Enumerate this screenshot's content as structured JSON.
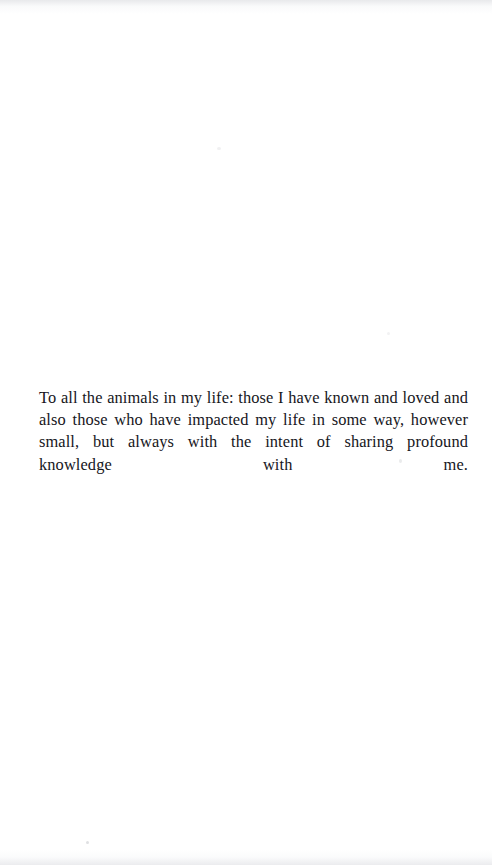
{
  "page": {
    "kind": "book-dedication-page",
    "background_color": "#ffffff",
    "text_color": "#16161c",
    "width_px": 492,
    "height_px": 865
  },
  "dedication": {
    "text": "To all the animals in my life: those I have known and loved and also those who have impacted my life in some way, however small, but always with the intent of sharing profound knowledge with me.",
    "lines": [
      "To all the animals in my life: those I have known and loved and also",
      "those who have impacted my life in some way, however small, but always",
      "with the intent of sharing profound knowledge with me."
    ],
    "alignment": "justified"
  },
  "artifacts": {
    "description": "faint scanner specks and edge tone bands",
    "speck_count": 4
  }
}
